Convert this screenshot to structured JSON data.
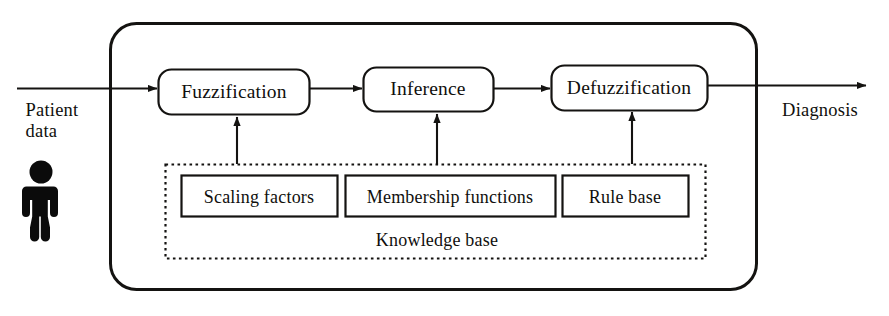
{
  "diagram": {
    "type": "block-flow-diagram",
    "colors": {
      "line": "#141311",
      "text": "#100f0d",
      "background": "#ffffff",
      "icon": "#0b0b0b"
    },
    "input": {
      "label_line1": "Patient",
      "label_line2": "data",
      "icon": "person-icon"
    },
    "output": {
      "label": "Diagnosis"
    },
    "stages": [
      {
        "id": "fuzzification",
        "label": "Fuzzification"
      },
      {
        "id": "inference",
        "label": "Inference"
      },
      {
        "id": "defuzzification",
        "label": "Defuzzification"
      }
    ],
    "knowledge_base": {
      "title": "Knowledge base",
      "items": [
        {
          "id": "scaling-factors",
          "label": "Scaling factors"
        },
        {
          "id": "membership-functions",
          "label": "Membership functions"
        },
        {
          "id": "rule-base",
          "label": "Rule base"
        }
      ]
    }
  }
}
